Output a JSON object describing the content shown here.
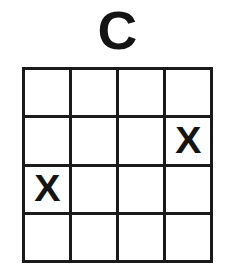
{
  "puzzle": {
    "title": "C",
    "grid": {
      "rows": 4,
      "columns": 4,
      "empty_symbol": "",
      "mark_symbol": "X",
      "cells": [
        [
          "",
          "",
          "",
          ""
        ],
        [
          "",
          "",
          "",
          "X"
        ],
        [
          "X",
          "",
          "",
          ""
        ],
        [
          "",
          "",
          "",
          ""
        ]
      ],
      "marked_positions": [
        {
          "row": 2,
          "column": 4,
          "symbol": "X"
        },
        {
          "row": 3,
          "column": 1,
          "symbol": "X"
        }
      ]
    }
  },
  "colors": {
    "background": "#ffffff",
    "line": "#1a1a1a",
    "text": "#141414"
  }
}
